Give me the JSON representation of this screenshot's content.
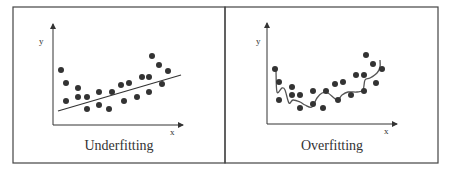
{
  "colors": {
    "ink": "#333333",
    "frame": "#444444",
    "background": "#ffffff"
  },
  "panels": [
    {
      "caption": "Underfitting",
      "x_label": "x",
      "y_label": "y",
      "fit": "linear"
    },
    {
      "caption": "Overfitting",
      "x_label": "x",
      "y_label": "y",
      "fit": "wiggly-curve"
    }
  ],
  "chart_data": [
    {
      "type": "scatter",
      "title": "Underfitting",
      "xlabel": "x",
      "ylabel": "y",
      "grid": false,
      "points": [
        [
          61,
          70
        ],
        [
          66,
          83
        ],
        [
          66,
          101
        ],
        [
          78,
          88
        ],
        [
          78,
          97
        ],
        [
          87,
          97
        ],
        [
          87,
          109
        ],
        [
          99,
          92
        ],
        [
          99,
          105
        ],
        [
          109,
          109
        ],
        [
          112,
          92
        ],
        [
          121,
          85
        ],
        [
          124,
          101
        ],
        [
          129,
          83
        ],
        [
          137,
          97
        ],
        [
          142,
          77
        ],
        [
          149,
          77
        ],
        [
          149,
          92
        ],
        [
          152,
          56
        ],
        [
          159,
          65
        ],
        [
          162,
          84
        ],
        [
          168,
          71
        ]
      ],
      "fit_line": [
        [
          58,
          111
        ],
        [
          181,
          75
        ]
      ]
    },
    {
      "type": "scatter",
      "title": "Overfitting",
      "xlabel": "x",
      "ylabel": "y",
      "grid": false,
      "points": [
        [
          275,
          69
        ],
        [
          279,
          82
        ],
        [
          279,
          100
        ],
        [
          292,
          87
        ],
        [
          292,
          95
        ],
        [
          300,
          95
        ],
        [
          300,
          108
        ],
        [
          313,
          91
        ],
        [
          313,
          104
        ],
        [
          323,
          108
        ],
        [
          326,
          91
        ],
        [
          335,
          84
        ],
        [
          338,
          100
        ],
        [
          343,
          82
        ],
        [
          351,
          95
        ],
        [
          356,
          75
        ],
        [
          364,
          75
        ],
        [
          364,
          91
        ],
        [
          366,
          55
        ],
        [
          373,
          64
        ],
        [
          376,
          83
        ],
        [
          382,
          69
        ]
      ],
      "fit_curve": [
        [
          276,
          70
        ],
        [
          277,
          92
        ],
        [
          282,
          88
        ],
        [
          285,
          90
        ],
        [
          289,
          103
        ],
        [
          293,
          100
        ],
        [
          300,
          102
        ],
        [
          305,
          105
        ],
        [
          312,
          107
        ],
        [
          317,
          98
        ],
        [
          322,
          93
        ],
        [
          328,
          93
        ],
        [
          337,
          100
        ],
        [
          342,
          95
        ],
        [
          348,
          92
        ],
        [
          357,
          92
        ],
        [
          363,
          90
        ],
        [
          365,
          80
        ],
        [
          370,
          78
        ],
        [
          377,
          73
        ],
        [
          380,
          67
        ],
        [
          380,
          60
        ]
      ]
    }
  ]
}
